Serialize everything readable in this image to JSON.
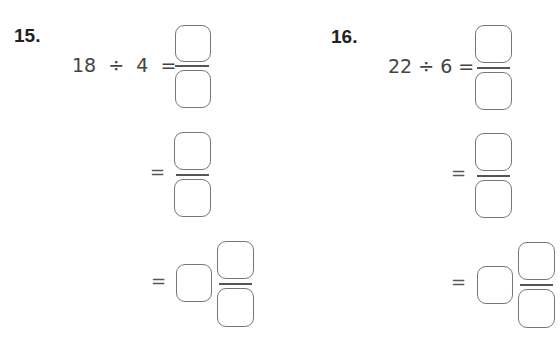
{
  "problems": [
    {
      "number": "15.",
      "expression": "18  ÷  4  =",
      "steps": [
        {
          "prefix": "",
          "type": "fraction"
        },
        {
          "prefix": "=",
          "type": "fraction"
        },
        {
          "prefix": "=",
          "type": "mixed-number"
        }
      ]
    },
    {
      "number": "16.",
      "expression": "22 ÷ 6 =",
      "steps": [
        {
          "prefix": "",
          "type": "fraction"
        },
        {
          "prefix": "=",
          "type": "fraction"
        },
        {
          "prefix": "=",
          "type": "mixed-number"
        }
      ]
    }
  ]
}
